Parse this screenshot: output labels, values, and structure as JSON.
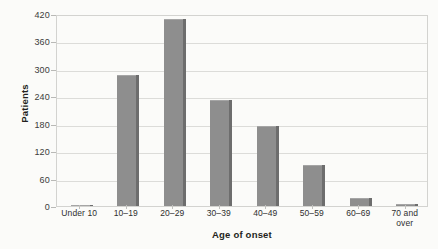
{
  "chart_data": {
    "type": "bar",
    "title": "",
    "xlabel": "Age of onset",
    "ylabel": "Patients",
    "categories": [
      "Under 10",
      "10–19",
      "20–29",
      "30–39",
      "40–49",
      "50–59",
      "60–69",
      "70 and over"
    ],
    "values": [
      2,
      287,
      409,
      232,
      175,
      90,
      17,
      4
    ],
    "ylim": [
      0,
      420
    ],
    "yticks": [
      0,
      60,
      120,
      180,
      240,
      300,
      360,
      420
    ],
    "ytick_labels": [
      "0",
      "60",
      "120",
      "180",
      "240",
      "300",
      "360",
      "420"
    ],
    "grid": "horizontal",
    "legend": "none",
    "series": [
      {
        "name": "Patients",
        "color": "#8e8e8e",
        "values": [
          2,
          287,
          409,
          232,
          175,
          90,
          17,
          4
        ]
      }
    ]
  },
  "colors": {
    "bar_fill": "#8e8e8e",
    "bar_shadow": "#6d6d6d",
    "gridline": "#dcdcd9",
    "plot_border": "#d3d3d0",
    "background": "#fbfbf9",
    "text": "#231f20"
  }
}
